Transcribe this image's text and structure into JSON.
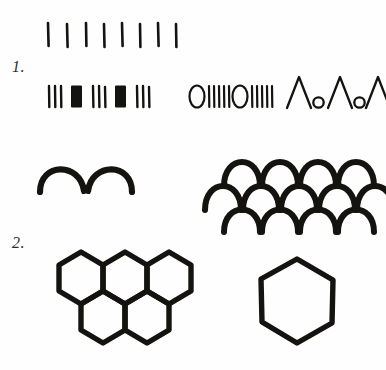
{
  "page": {
    "background": "#fefefe",
    "ink_color": "#15130f",
    "width": 386,
    "height": 370,
    "kind": "hand-drawn pattern worksheet"
  },
  "sections": [
    {
      "number_label": "1.",
      "name": "linear-repeating-patterns",
      "rows": [
        {
          "name": "tally-row",
          "description": "row of evenly spaced single vertical strokes",
          "motif": "|",
          "count": 8
        },
        {
          "name": "bar-and-block-row",
          "description": "alternating groups of three thin bars and one solid filled block",
          "sequence": [
            "|||",
            "block",
            "|||",
            "block",
            "|||"
          ],
          "thin_group_count": 3,
          "block_count": 2
        },
        {
          "name": "circle-and-bar-row",
          "description": "open ellipse followed by five vertical bars, repeated twice",
          "sequence": [
            "O",
            "|||||",
            "O",
            "|||||"
          ],
          "repeat": 2,
          "bars_per_group": 5
        },
        {
          "name": "lambda-and-circle-row",
          "description": "chevron peak followed by small open circle, repeated three times",
          "sequence": [
            "Λ",
            "o",
            "Λ",
            "o",
            "Λ",
            "o"
          ],
          "repeat": 3
        }
      ]
    },
    {
      "name": "arch-patterns",
      "rows": [
        {
          "name": "arch-pair",
          "description": "two thick semicircular arches sharing a cusp",
          "arch_count": 2
        },
        {
          "name": "fish-scale-pattern",
          "description": "imbricate scale pattern of thick arches in offset rows",
          "rows": 3,
          "arches_per_row": [
            4,
            4,
            3
          ],
          "offset": "half-pitch"
        }
      ]
    },
    {
      "number_label": "2.",
      "name": "hexagon-patterns",
      "rows": [
        {
          "name": "honeycomb-cluster",
          "description": "tessellated honeycomb of hexagons, three in the upper band and two in the lower band",
          "hexagon_count": 5,
          "upper_row": 3,
          "lower_row": 2
        },
        {
          "name": "single-hexagon",
          "description": "one isolated regular hexagon outline",
          "hexagon_count": 1
        }
      ]
    }
  ],
  "annotations": {
    "section_one": "1.",
    "section_two": "2."
  }
}
